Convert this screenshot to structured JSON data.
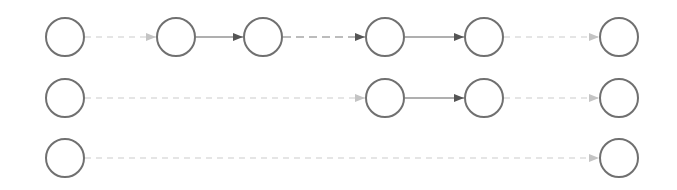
{
  "diagram": {
    "width": 677,
    "height": 190,
    "node_radius": 19,
    "colors": {
      "node_stroke": "#707070",
      "node_fill": "#ffffff",
      "solid_edge": "#606060",
      "dark_dashed_edge": "#7a7a7a",
      "light_dashed_edge": "#cccccc",
      "light_arrowhead": "#c4c4c4"
    },
    "nodes": [
      {
        "id": "r1c1",
        "row": 1,
        "cx": 65,
        "cy": 37
      },
      {
        "id": "r1c2",
        "row": 1,
        "cx": 176,
        "cy": 37
      },
      {
        "id": "r1c3",
        "row": 1,
        "cx": 263,
        "cy": 37
      },
      {
        "id": "r1c4",
        "row": 1,
        "cx": 385,
        "cy": 37
      },
      {
        "id": "r1c5",
        "row": 1,
        "cx": 484,
        "cy": 37
      },
      {
        "id": "r1c6",
        "row": 1,
        "cx": 619,
        "cy": 37
      },
      {
        "id": "r2c1",
        "row": 2,
        "cx": 65,
        "cy": 98
      },
      {
        "id": "r2c4",
        "row": 2,
        "cx": 385,
        "cy": 98
      },
      {
        "id": "r2c5",
        "row": 2,
        "cx": 484,
        "cy": 98
      },
      {
        "id": "r2c6",
        "row": 2,
        "cx": 619,
        "cy": 98
      },
      {
        "id": "r3c1",
        "row": 3,
        "cx": 65,
        "cy": 158
      },
      {
        "id": "r3c6",
        "row": 3,
        "cx": 619,
        "cy": 158
      }
    ],
    "edges": [
      {
        "from": "r1c1",
        "to": "r1c2",
        "style": "light-dashed"
      },
      {
        "from": "r1c2",
        "to": "r1c3",
        "style": "solid"
      },
      {
        "from": "r1c3",
        "to": "r1c4",
        "style": "dark-dashed"
      },
      {
        "from": "r1c4",
        "to": "r1c5",
        "style": "solid"
      },
      {
        "from": "r1c5",
        "to": "r1c6",
        "style": "light-dashed"
      },
      {
        "from": "r2c1",
        "to": "r2c4",
        "style": "light-dashed"
      },
      {
        "from": "r2c4",
        "to": "r2c5",
        "style": "solid"
      },
      {
        "from": "r2c5",
        "to": "r2c6",
        "style": "light-dashed"
      },
      {
        "from": "r3c1",
        "to": "r3c6",
        "style": "light-dashed"
      }
    ]
  }
}
